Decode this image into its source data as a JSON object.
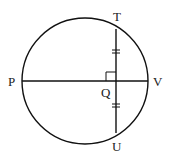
{
  "diagram": {
    "labels": {
      "P": "P",
      "V": "V",
      "T": "T",
      "U": "U",
      "Q": "Q"
    },
    "right_angle_at": "Q",
    "equal_segments": [
      "TQ",
      "QU"
    ],
    "colors": {
      "stroke": "#111111",
      "background": "#ffffff"
    }
  }
}
